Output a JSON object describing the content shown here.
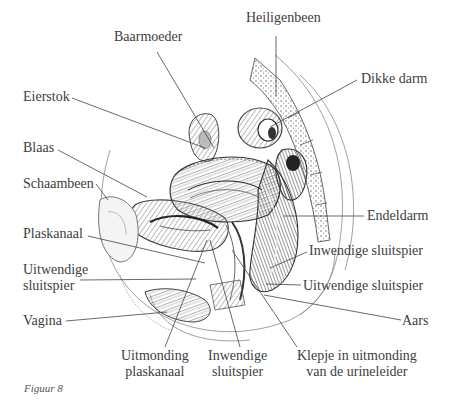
{
  "diagram": {
    "caption": "Figuur 8",
    "labels": [
      {
        "id": "baarmoeder",
        "text": "Baarmoeder",
        "x": 114,
        "y": 37,
        "anchor": [
          212,
          150
        ]
      },
      {
        "id": "heiligenbeen",
        "text": "Heiligenbeen",
        "x": 246,
        "y": 18,
        "anchor": [
          276,
          100
        ]
      },
      {
        "id": "eierstok",
        "text": "Eierstok",
        "x": 23,
        "y": 89,
        "anchor": [
          210,
          150
        ]
      },
      {
        "id": "dikke-darm",
        "text": "Dikke darm",
        "x": 360,
        "y": 73,
        "anchor": [
          270,
          125
        ]
      },
      {
        "id": "blaas",
        "text": "Blaas",
        "x": 23,
        "y": 142,
        "anchor": [
          145,
          195
        ]
      },
      {
        "id": "schaambeen",
        "text": "Schaambeen",
        "x": 23,
        "y": 175,
        "anchor": [
          100,
          190
        ]
      },
      {
        "id": "endeldarm",
        "text": "Endeldarm",
        "x": 367,
        "y": 210,
        "anchor": [
          283,
          216
        ]
      },
      {
        "id": "plaskanaal",
        "text": "Plaskanaal",
        "x": 23,
        "y": 228,
        "anchor": [
          205,
          263
        ]
      },
      {
        "id": "inwendige-sluitspier-r",
        "text": "Inwendige sluitspier",
        "x": 309,
        "y": 244,
        "anchor": [
          270,
          268
        ]
      },
      {
        "id": "uitwendige-sluitspier-l",
        "text": "Uitwendige\nsluitspier",
        "x": 23,
        "y": 262,
        "anchor": [
          196,
          279
        ]
      },
      {
        "id": "uitwendige-sluitspier-r",
        "text": "Uitwendige sluitspier",
        "x": 303,
        "y": 279,
        "anchor": [
          265,
          283
        ]
      },
      {
        "id": "aars",
        "text": "Aars",
        "x": 403,
        "y": 312,
        "anchor": [
          265,
          295
        ]
      },
      {
        "id": "vagina",
        "text": "Vagina",
        "x": 23,
        "y": 313,
        "anchor": [
          165,
          312
        ]
      },
      {
        "id": "uitmonding-plaskanaal",
        "text": "Uitmonding\nplaskanaal",
        "x": 121,
        "y": 348,
        "anchor": [
          207,
          240
        ]
      },
      {
        "id": "inwendige-sluitspier-b",
        "text": "Inwendige\nsluitspier",
        "x": 210,
        "y": 348,
        "anchor": [
          210,
          240
        ]
      },
      {
        "id": "klepje",
        "text": "Klepje in uitmonding\nvan de urineleider",
        "x": 297,
        "y": 348,
        "anchor": [
          235,
          250
        ]
      }
    ],
    "colors": {
      "ink": "#3d3d3d",
      "line": "#444444",
      "shade_dark": "#4a4a4a",
      "shade_mid": "#8a8a8a",
      "shade_light": "#c8c8c8",
      "paper": "#ffffff"
    }
  }
}
